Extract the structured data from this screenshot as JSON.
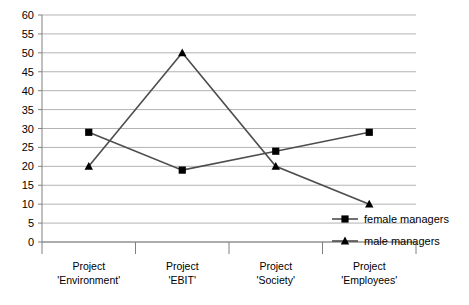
{
  "chart_data": {
    "type": "line",
    "title": "",
    "xlabel": "",
    "ylabel": "",
    "ylim": [
      0,
      60
    ],
    "ytick_step": 5,
    "grid": true,
    "legend_position": "bottom-right",
    "categories": [
      "Project 'Environment'",
      "Project 'EBIT'",
      "Project 'Society'",
      "Project 'Employees'"
    ],
    "category_lines": [
      [
        "Project",
        "'Environment'"
      ],
      [
        "Project",
        "'EBIT'"
      ],
      [
        "Project",
        "'Society'"
      ],
      [
        "Project",
        "'Employees'"
      ]
    ],
    "yticks": [
      0,
      5,
      10,
      15,
      20,
      25,
      30,
      35,
      40,
      45,
      50,
      55,
      60
    ],
    "ytick_labels": [
      "0",
      "5",
      "10",
      "15",
      "20",
      "25",
      "30",
      "35",
      "40",
      "45",
      "50",
      "55",
      "60"
    ],
    "series": [
      {
        "name": "female managers",
        "marker": "square",
        "color": "#4d4d4d",
        "marker_color": "#000000",
        "values": [
          29,
          19,
          24,
          29
        ]
      },
      {
        "name": "male managers",
        "marker": "triangle",
        "color": "#4d4d4d",
        "marker_color": "#000000",
        "values": [
          20,
          50,
          20,
          10
        ]
      }
    ]
  },
  "legend": {
    "items": [
      {
        "label": "female managers",
        "marker": "square"
      },
      {
        "label": "male managers",
        "marker": "triangle"
      }
    ]
  },
  "colors": {
    "background": "#ffffff",
    "gridline": "#b3b3b3",
    "axis": "#808080",
    "series_line": "#4d4d4d",
    "marker": "#000000",
    "text": "#000000"
  }
}
